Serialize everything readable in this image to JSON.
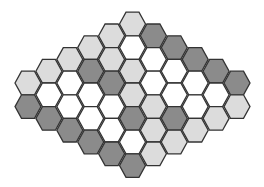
{
  "game": {
    "name": "hex-board",
    "colors": {
      "dark": "#8b8b8b",
      "light": "#dcdcdc",
      "empty": "#ffffff",
      "border": "#333333"
    },
    "columns": [
      [
        "light",
        "dark"
      ],
      [
        "light",
        "empty",
        "dark"
      ],
      [
        "light",
        "empty",
        "empty",
        "dark"
      ],
      [
        "light",
        "dark",
        "empty",
        "empty",
        "dark"
      ],
      [
        "light",
        "light",
        "dark",
        "empty",
        "empty",
        "dark"
      ],
      [
        "light",
        "empty",
        "light",
        "light",
        "dark",
        "empty",
        "dark"
      ],
      [
        "dark",
        "empty",
        "empty",
        "light",
        "light",
        "light"
      ],
      [
        "dark",
        "empty",
        "empty",
        "dark",
        "light"
      ],
      [
        "dark",
        "empty",
        "empty",
        "light"
      ],
      [
        "dark",
        "empty",
        "light"
      ],
      [
        "dark",
        "light"
      ]
    ]
  }
}
